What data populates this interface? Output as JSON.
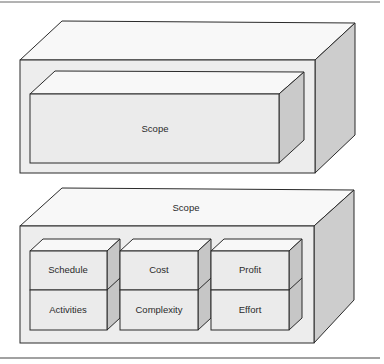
{
  "diagram": {
    "top_box": {
      "inner_box": {
        "label": "Scope"
      }
    },
    "bottom_box": {
      "label": "Scope",
      "cells": [
        {
          "row": 0,
          "col": 0,
          "label": "Schedule"
        },
        {
          "row": 0,
          "col": 1,
          "label": "Cost"
        },
        {
          "row": 0,
          "col": 2,
          "label": "Profit"
        },
        {
          "row": 1,
          "col": 0,
          "label": "Activities"
        },
        {
          "row": 1,
          "col": 1,
          "label": "Complexity"
        },
        {
          "row": 1,
          "col": 2,
          "label": "Effort"
        }
      ]
    },
    "colors": {
      "stroke": "#2b2b2b",
      "front_face": "#ececec",
      "top_face": "#f7f7f7",
      "side_face": "#c9c9c9",
      "rule": "#555555"
    }
  }
}
